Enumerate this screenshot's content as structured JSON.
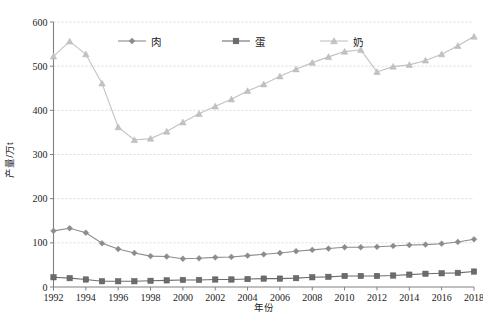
{
  "chart_data": {
    "type": "line",
    "title": "",
    "xlabel": "年份",
    "ylabel": "产量/万t",
    "xlim": [
      1992,
      2018
    ],
    "ylim": [
      0,
      600
    ],
    "yticks": [
      0,
      100,
      200,
      300,
      400,
      500,
      600
    ],
    "xticks": [
      1992,
      1994,
      1996,
      1998,
      2000,
      2002,
      2004,
      2006,
      2008,
      2010,
      2012,
      2014,
      2016,
      2018
    ],
    "grid": true,
    "legend_position": "top-center",
    "x": [
      1992,
      1993,
      1994,
      1995,
      1996,
      1997,
      1998,
      1999,
      2000,
      2001,
      2002,
      2003,
      2004,
      2005,
      2006,
      2007,
      2008,
      2009,
      2010,
      2011,
      2012,
      2013,
      2014,
      2015,
      2016,
      2017,
      2018
    ],
    "series": [
      {
        "name": "肉",
        "marker": "diamond",
        "color": "#8c8c8c",
        "values": [
          127,
          133,
          123,
          99,
          86,
          77,
          70,
          69,
          64,
          65,
          67,
          68,
          71,
          74,
          77,
          81,
          84,
          87,
          90,
          90,
          91,
          93,
          95,
          96,
          98,
          102,
          108
        ]
      },
      {
        "name": "蛋",
        "marker": "square",
        "color": "#6b6b6b",
        "values": [
          22,
          20,
          17,
          13,
          13,
          13,
          14,
          15,
          16,
          16,
          17,
          17,
          18,
          19,
          19,
          20,
          22,
          23,
          25,
          25,
          25,
          26,
          28,
          30,
          31,
          32,
          35
        ]
      },
      {
        "name": "奶",
        "marker": "triangle",
        "color": "#c2c2c2",
        "values": [
          522,
          556,
          527,
          461,
          362,
          333,
          336,
          352,
          373,
          392,
          409,
          425,
          444,
          459,
          477,
          493,
          508,
          521,
          533,
          537,
          487,
          499,
          503,
          513,
          527,
          546,
          567
        ]
      }
    ]
  },
  "axis": {
    "y_title": "产量/万t",
    "x_title": "年份",
    "y_ticks": [
      "0",
      "100",
      "200",
      "300",
      "400",
      "500",
      "600"
    ],
    "x_ticks": [
      "1992",
      "1994",
      "1996",
      "1998",
      "2000",
      "2002",
      "2004",
      "2006",
      "2008",
      "2010",
      "2012",
      "2014",
      "2016",
      "2018"
    ]
  },
  "legend": {
    "items": [
      {
        "label": "肉",
        "marker": "diamond-marker",
        "color": "#8c8c8c"
      },
      {
        "label": "蛋",
        "marker": "square-marker",
        "color": "#6b6b6b"
      },
      {
        "label": "奶",
        "marker": "triangle-marker",
        "color": "#c2c2c2"
      }
    ]
  },
  "caption": {
    "text": ""
  }
}
